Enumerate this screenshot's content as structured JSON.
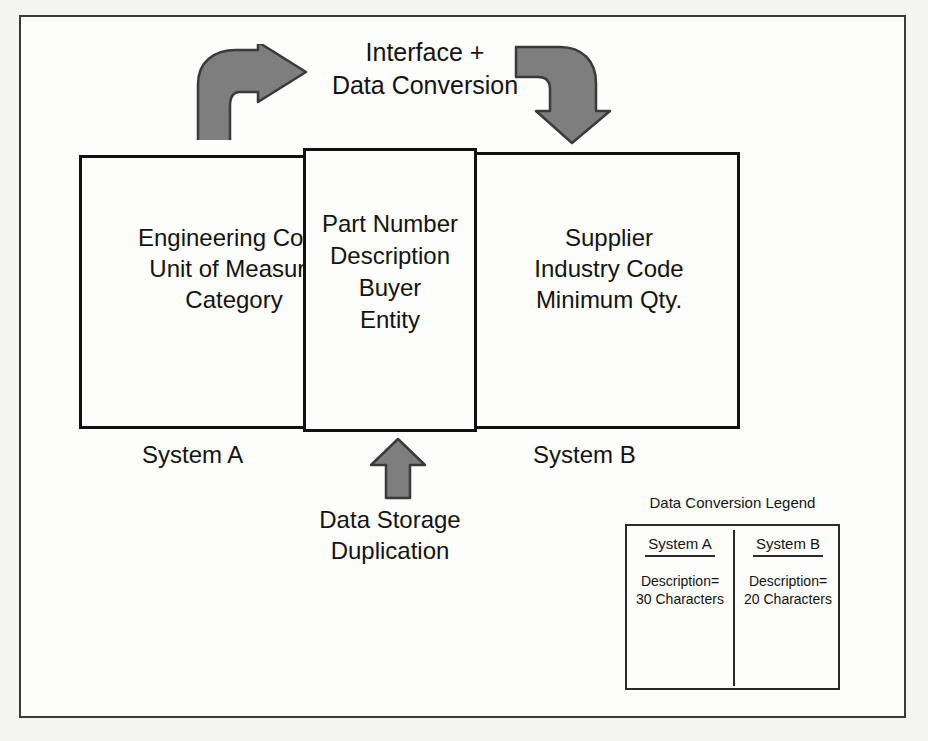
{
  "diagram": {
    "top_label": {
      "line1": "Interface +",
      "line2": "Data Conversion"
    },
    "system_a": {
      "caption": "System A",
      "fields": [
        "Engineering Code",
        "Unit of Measure",
        "Category"
      ]
    },
    "shared": {
      "fields": [
        "Part Number",
        "Description",
        "Buyer",
        "Entity"
      ]
    },
    "system_b": {
      "caption": "System B",
      "fields": [
        "Supplier",
        "Industry Code",
        "Minimum Qty."
      ]
    },
    "bottom_label": {
      "line1": "Data Storage",
      "line2": "Duplication"
    },
    "arrows": {
      "left": "curved-arrow-right-icon",
      "right": "curved-arrow-down-icon",
      "bottom": "arrow-up-icon"
    },
    "colors": {
      "arrow_fill": "#7e7e7e",
      "arrow_stroke": "#3a3a3a",
      "line": "#111111",
      "background": "#fdfdfc"
    }
  },
  "legend": {
    "title": "Data Conversion Legend",
    "columns": [
      {
        "header": "System A",
        "line1": "Description=",
        "line2": "30 Characters"
      },
      {
        "header": "System B",
        "line1": "Description=",
        "line2": "20 Characters"
      }
    ]
  }
}
